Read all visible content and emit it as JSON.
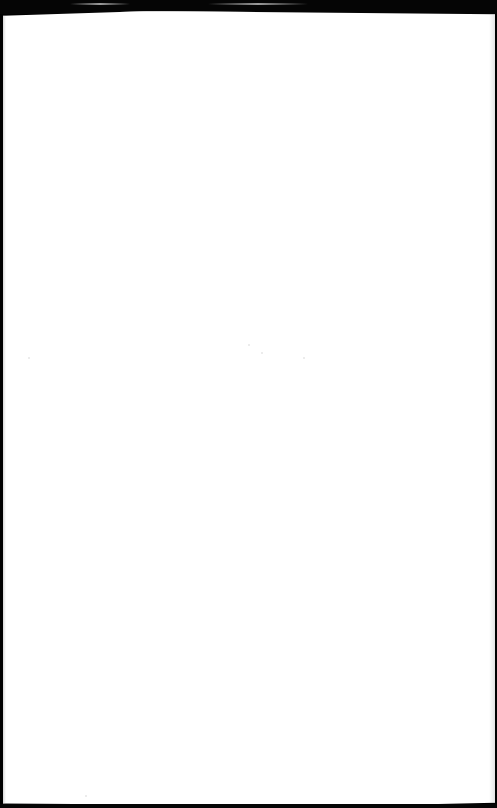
{
  "page": {
    "content_text": "",
    "colors": {
      "background": "#000000",
      "sheet": "#ffffff"
    }
  }
}
